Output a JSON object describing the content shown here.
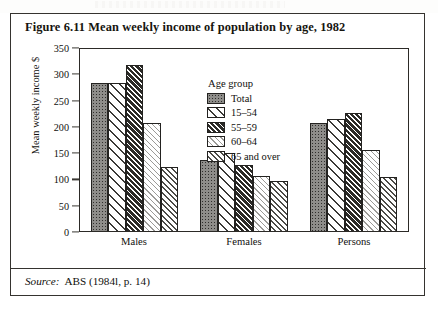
{
  "figure": {
    "title": "Figure 6.11  Mean weekly income of population by age, 1982",
    "source_label": "Source:",
    "source_text": "ABS (1984l, p. 14)"
  },
  "legend": {
    "title": "Age group",
    "entries": [
      {
        "label": "Total",
        "pattern": "dark-stipple"
      },
      {
        "label": "15–54",
        "pattern": "sparse-diagonal"
      },
      {
        "label": "55–59",
        "pattern": "dense-dark-diagonal"
      },
      {
        "label": "60–64",
        "pattern": "fine-light-diagonal"
      },
      {
        "label": "65 and over",
        "pattern": "medium-diagonal"
      }
    ]
  },
  "axes": {
    "y_label": "Mean weekly income $",
    "y_ticks": [
      "0",
      "50",
      "100",
      "150",
      "200",
      "250",
      "300",
      "350"
    ],
    "x_ticks": [
      "Males",
      "Females",
      "Persons"
    ]
  },
  "chart_data": {
    "type": "bar",
    "title": "Figure 6.11  Mean weekly income of population by age, 1982",
    "xlabel": "",
    "ylabel": "Mean weekly income $",
    "ylim": [
      0,
      350
    ],
    "ytick_step": 50,
    "grid": false,
    "legend_position": "inside-top-center",
    "legend_title": "Age group",
    "categories": [
      "Males",
      "Females",
      "Persons"
    ],
    "series": [
      {
        "name": "Total",
        "values": [
          281,
          135,
          206
        ]
      },
      {
        "name": "15–54",
        "values": [
          281,
          148,
          213
        ]
      },
      {
        "name": "55–59",
        "values": [
          316,
          125,
          225
        ]
      },
      {
        "name": "60–64",
        "values": [
          206,
          104,
          154
        ]
      },
      {
        "name": "65 and over",
        "values": [
          122,
          95,
          103
        ]
      }
    ],
    "source": "Source: ABS (1984l, p. 14)"
  },
  "colors": {
    "ink": "#231f1c",
    "frame": "#35332f",
    "paper": "#ffffff"
  }
}
